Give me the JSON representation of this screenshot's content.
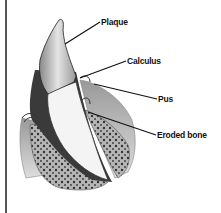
{
  "figure": {
    "labels": [
      {
        "id": "plaque",
        "text": "Plaque",
        "x": 101,
        "y": 17
      },
      {
        "id": "calculus",
        "text": "Calculus",
        "x": 127,
        "y": 56
      },
      {
        "id": "pus",
        "text": "Pus",
        "x": 158,
        "y": 94
      },
      {
        "id": "eroded_bone",
        "text": "Eroded bone",
        "x": 157,
        "y": 130
      }
    ],
    "colors": {
      "ink": "#111111",
      "gum": "#7a7a7a",
      "bone": "#a0a0a0",
      "enamel": "#d8d8d8",
      "root": "#f2f2f2"
    }
  }
}
